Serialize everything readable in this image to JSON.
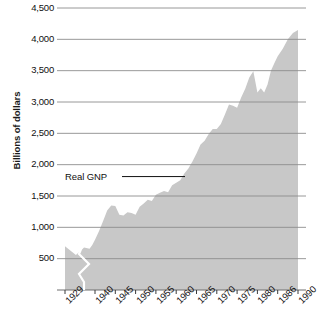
{
  "chart_data": {
    "type": "area",
    "title": "",
    "xlabel": "",
    "ylabel": "Billions of dollars",
    "series_name": "Real GNP",
    "annotation": "Real GNP",
    "ylim": [
      0,
      4500
    ],
    "ytick_labels": [
      "4,500",
      "4,000",
      "3,500",
      "3,000",
      "2,500",
      "2,000",
      "1,500",
      "1,000",
      "500"
    ],
    "ytick_values": [
      4500,
      4000,
      3500,
      3000,
      2500,
      2000,
      1500,
      1000,
      500
    ],
    "xtick_labels": [
      "1929",
      "1940",
      "1945",
      "1950",
      "1955",
      "1960",
      "1965",
      "1970",
      "1975",
      "1980",
      "1986",
      "1990"
    ],
    "xtick_values": [
      1929,
      1940,
      1945,
      1950,
      1955,
      1960,
      1965,
      1970,
      1975,
      1980,
      1986,
      1990
    ],
    "axis_break": {
      "between": [
        "1929",
        "1940"
      ],
      "style": "zigzag"
    },
    "grid": true,
    "legend": "none",
    "fill_color": "#c8c8c8",
    "grid_color": "#8d8d8d",
    "x": [
      1929,
      1933,
      1936,
      1938,
      1939,
      1940,
      1941,
      1942,
      1943,
      1944,
      1945,
      1946,
      1947,
      1948,
      1949,
      1950,
      1951,
      1952,
      1953,
      1954,
      1955,
      1956,
      1957,
      1958,
      1959,
      1960,
      1961,
      1962,
      1963,
      1964,
      1965,
      1966,
      1967,
      1968,
      1969,
      1970,
      1971,
      1972,
      1973,
      1974,
      1975,
      1976,
      1977,
      1978,
      1979,
      1980,
      1981,
      1982,
      1983,
      1984,
      1985,
      1986,
      1987,
      1988,
      1989,
      1990
    ],
    "values": [
      700,
      560,
      680,
      660,
      720,
      800,
      940,
      1100,
      1270,
      1350,
      1340,
      1200,
      1190,
      1240,
      1230,
      1200,
      1330,
      1380,
      1440,
      1420,
      1520,
      1550,
      1580,
      1560,
      1670,
      1710,
      1750,
      1860,
      1940,
      2050,
      2180,
      2320,
      2380,
      2490,
      2570,
      2570,
      2650,
      2800,
      2960,
      2940,
      2910,
      3070,
      3210,
      3390,
      3490,
      3150,
      3220,
      3150,
      3280,
      3500,
      3620,
      3730,
      3850,
      4000,
      4100,
      4150
    ],
    "units": "Billions of dollars",
    "peak_value": 4150,
    "peak_year": 1990,
    "start_value": 700,
    "start_year": 1929
  }
}
